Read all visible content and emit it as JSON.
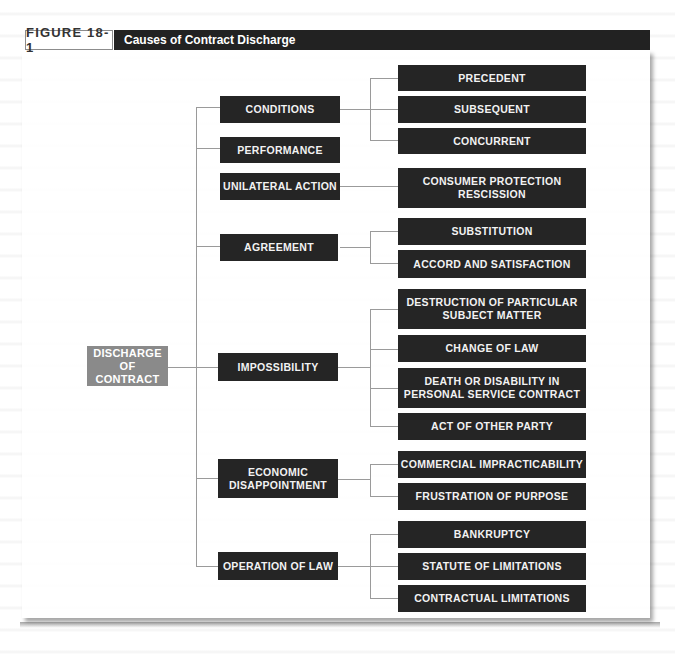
{
  "figure": {
    "label": "FIGURE 18-1",
    "title": "Causes of Contract Discharge"
  },
  "root": {
    "label": "DISCHARGE\nOF CONTRACT",
    "line1": "DISCHARGE",
    "line2": "OF CONTRACT"
  },
  "categories": [
    {
      "label": "CONDITIONS",
      "children": [
        "PRECEDENT",
        "SUBSEQUENT",
        "CONCURRENT"
      ]
    },
    {
      "label": "PERFORMANCE",
      "children": []
    },
    {
      "label": "UNILATERAL ACTION",
      "children": [
        "CONSUMER PROTECTION RESCISSION"
      ]
    },
    {
      "label": "AGREEMENT",
      "children": [
        "SUBSTITUTION",
        "ACCORD AND SATISFACTION"
      ]
    },
    {
      "label": "IMPOSSIBILITY",
      "children": [
        "DESTRUCTION OF PARTICULAR SUBJECT MATTER",
        "CHANGE OF LAW",
        "DEATH OR DISABILITY IN PERSONAL SERVICE CONTRACT",
        "ACT OF OTHER PARTY"
      ]
    },
    {
      "label": "ECONOMIC DISAPPOINTMENT",
      "children": [
        "COMMERCIAL IMPRACTICABILITY",
        "FRUSTRATION OF PURPOSE"
      ]
    },
    {
      "label": "OPERATION OF LAW",
      "children": [
        "BANKRUPTCY",
        "STATUTE OF LIMITATIONS",
        "CONTRACTUAL LIMITATIONS"
      ]
    }
  ],
  "boxes": {
    "conditions": "CONDITIONS",
    "performance": "PERFORMANCE",
    "unilateral": "UNILATERAL ACTION",
    "agreement": "AGREEMENT",
    "impossibility": "IMPOSSIBILITY",
    "economic_1": "ECONOMIC",
    "economic_2": "DISAPPOINTMENT",
    "operation": "OPERATION OF LAW",
    "precedent": "PRECEDENT",
    "subsequent": "SUBSEQUENT",
    "concurrent": "CONCURRENT",
    "consumer_1": "CONSUMER PROTECTION",
    "consumer_2": "RESCISSION",
    "substitution": "SUBSTITUTION",
    "accord": "ACCORD AND SATISFACTION",
    "destruction_1": "DESTRUCTION OF PARTICULAR",
    "destruction_2": "SUBJECT MATTER",
    "change_law": "CHANGE OF LAW",
    "death_1": "DEATH OR DISABILITY IN",
    "death_2": "PERSONAL SERVICE CONTRACT",
    "act_other": "ACT OF OTHER PARTY",
    "commercial": "COMMERCIAL IMPRACTICABILITY",
    "frustration": "FRUSTRATION OF PURPOSE",
    "bankruptcy": "BANKRUPTCY",
    "statute": "STATUTE OF LIMITATIONS",
    "contractual": "CONTRACTUAL LIMITATIONS"
  },
  "colors": {
    "box_dark": "#252525",
    "box_root": "#8a8a8a",
    "title_bar": "#222222",
    "connector": "#9a9a9a"
  }
}
